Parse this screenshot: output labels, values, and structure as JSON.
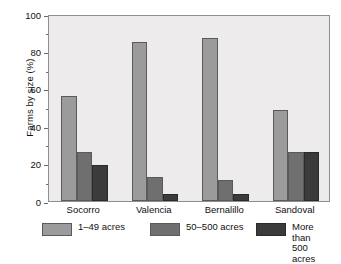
{
  "chart_data": {
    "type": "bar",
    "title": "",
    "xlabel": "",
    "ylabel": "Farms by size (%)",
    "ylim": [
      0,
      100
    ],
    "yticks": [
      0,
      20,
      40,
      60,
      80,
      100
    ],
    "ytick_labels": [
      "0",
      "20",
      "40",
      "60",
      "80",
      "100"
    ],
    "yminor_ticks": [
      10,
      30,
      50,
      70,
      90
    ],
    "grid": false,
    "legend_position": "below",
    "categories": [
      "Socorro",
      "Valencia",
      "Bernalillo",
      "Sandoval"
    ],
    "series": [
      {
        "name": "1–49 acres",
        "color": "#9b9b9b",
        "values": [
          56,
          85,
          87,
          48.5
        ]
      },
      {
        "name": "50–500 acres",
        "color": "#6f6f6f",
        "values": [
          26,
          13,
          11,
          26
        ]
      },
      {
        "name": "More than\n500 acres",
        "color": "#3b3b3b",
        "values": [
          19,
          4,
          4,
          26
        ]
      }
    ]
  },
  "legend": {
    "items": [
      {
        "label": "1–49 acres",
        "swatch": "s0"
      },
      {
        "label": "50–500 acres",
        "swatch": "s1"
      },
      {
        "label": "More than\n500 acres",
        "swatch": "s2"
      }
    ]
  },
  "colors": {
    "plot_background": "#edebeb",
    "page_background": "#ffffff",
    "frame": "#8e8e8e",
    "series_light": "#9b9b9b",
    "series_medium": "#6f6f6f",
    "series_dark": "#3b3b3b"
  }
}
